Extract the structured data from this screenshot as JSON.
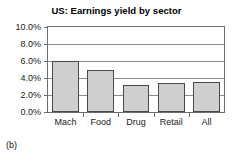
{
  "figure": {
    "caption": "(b)"
  },
  "chart_data": {
    "type": "bar",
    "title": "US: Earnings yield by sector",
    "xlabel": "",
    "ylabel": "",
    "categories": [
      "Mach",
      "Food",
      "Drug",
      "Retail",
      "All"
    ],
    "values": [
      6.0,
      5.0,
      3.2,
      3.4,
      3.5
    ],
    "value_labels": [
      "6.0%",
      "5.0%",
      "3.2%",
      "3.4%",
      "3.5%"
    ],
    "ylim": [
      0.0,
      10.0
    ],
    "ytick_values": [
      0.0,
      2.0,
      4.0,
      6.0,
      8.0,
      10.0
    ],
    "ytick_labels": [
      "0.0%",
      "2.0%",
      "4.0%",
      "6.0%",
      "8.0%",
      "10.0%"
    ],
    "grid": true,
    "grid_axis": "y",
    "legend": false,
    "legend_position": "none",
    "bar_fill_color": "#cfcfcf",
    "bar_edge_color": "#4a4a4a",
    "frame_color": "#6e6e6e",
    "background_color": "#ffffff"
  }
}
